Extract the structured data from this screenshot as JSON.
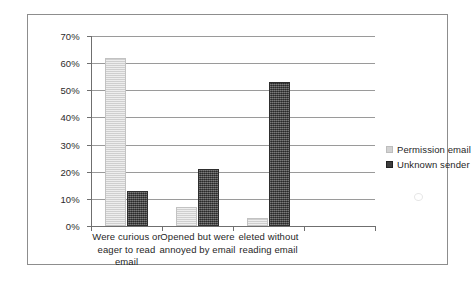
{
  "chart_data": {
    "type": "bar",
    "title": "",
    "xlabel": "",
    "ylabel": "",
    "ylim": [
      0,
      70
    ],
    "ytick_labels": [
      "0%",
      "10%",
      "20%",
      "30%",
      "40%",
      "50%",
      "60%",
      "70%"
    ],
    "ytick_values": [
      0,
      10,
      20,
      30,
      40,
      50,
      60,
      70
    ],
    "grid": true,
    "legend_position": "right",
    "categories": [
      "Were curious or eager to read email",
      "Opened but were annoyed by email",
      "eleted without reading email"
    ],
    "category_slots": 4,
    "series": [
      {
        "name": "Permission email",
        "color": "#d9d9d9",
        "values": [
          62,
          7,
          3
        ]
      },
      {
        "name": "Unknown sender",
        "color": "#4c4c4c",
        "values": [
          13,
          21,
          53
        ]
      }
    ]
  },
  "legend": {
    "items": [
      {
        "label": "Permission email"
      },
      {
        "label": "Unknown sender"
      }
    ]
  }
}
